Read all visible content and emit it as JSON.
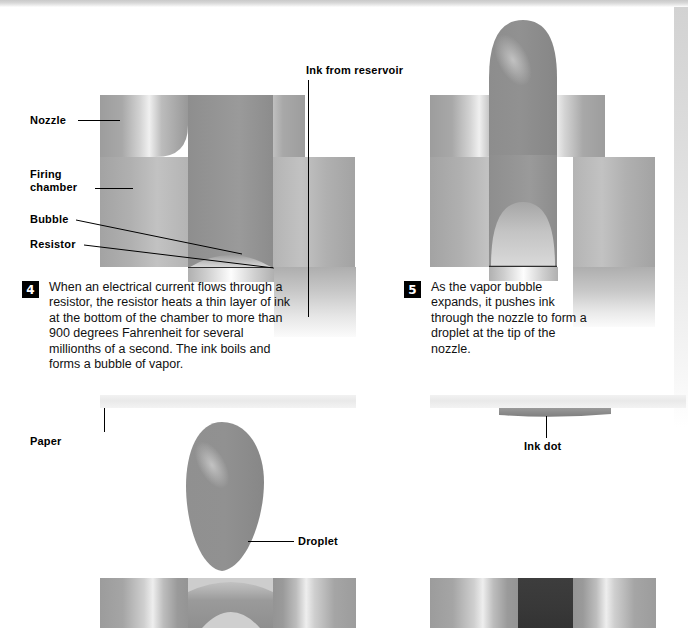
{
  "figure": {
    "type": "technical-cutaway-diagram"
  },
  "panels": {
    "step4": {
      "number": "4",
      "caption": "When an electrical current flows through a resistor, the resistor heats a thin layer of ink at the bottom of the chamber to more than 900 degrees Fahrenheit for several millionths of a second. The ink boils and forms a bubble of vapor."
    },
    "step5": {
      "number": "5",
      "caption": "As the vapor bubble expands, it pushes ink through the nozzle to form a droplet at the tip of the nozzle."
    }
  },
  "labels": {
    "nozzle": "Nozzle",
    "firing_chamber": "Firing\nchamber",
    "bubble": "Bubble",
    "resistor": "Resistor",
    "ink_from_reservoir": "Ink from reservoir",
    "paper": "Paper",
    "droplet": "Droplet",
    "ink_dot": "Ink dot"
  },
  "colors": {
    "ink": "#8a8a8a",
    "droplet": "#8e8e8e",
    "ink_dot": "#8b8b8b",
    "dark_ink_column": "#3a3a3a",
    "metal_light": "#d9d9d9",
    "metal_mid": "#a8a8a8",
    "metal_dark": "#8f8f8f",
    "paper": "#ededed",
    "badge_background": "#000000",
    "badge_text": "#ffffff",
    "label_text": "#000000"
  }
}
